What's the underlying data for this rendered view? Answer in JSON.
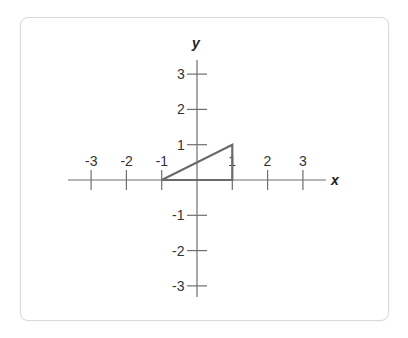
{
  "diagram": {
    "axes": {
      "x_label": "x",
      "y_label": "y",
      "x_ticks": [
        -3,
        -2,
        -1,
        1,
        2,
        3
      ],
      "y_ticks": [
        3,
        2,
        1,
        -1,
        -2,
        -3
      ],
      "origin_px": [
        197,
        180
      ],
      "unit_px": 35.3
    },
    "shape": {
      "type": "triangle",
      "vertices": [
        [
          -1,
          0
        ],
        [
          1,
          0
        ],
        [
          1,
          1
        ]
      ],
      "stroke_color": "#6b6b6b"
    },
    "colors": {
      "axis": "#6e6e6e",
      "text": "#333333",
      "card_border": "#d9d9d9"
    }
  }
}
